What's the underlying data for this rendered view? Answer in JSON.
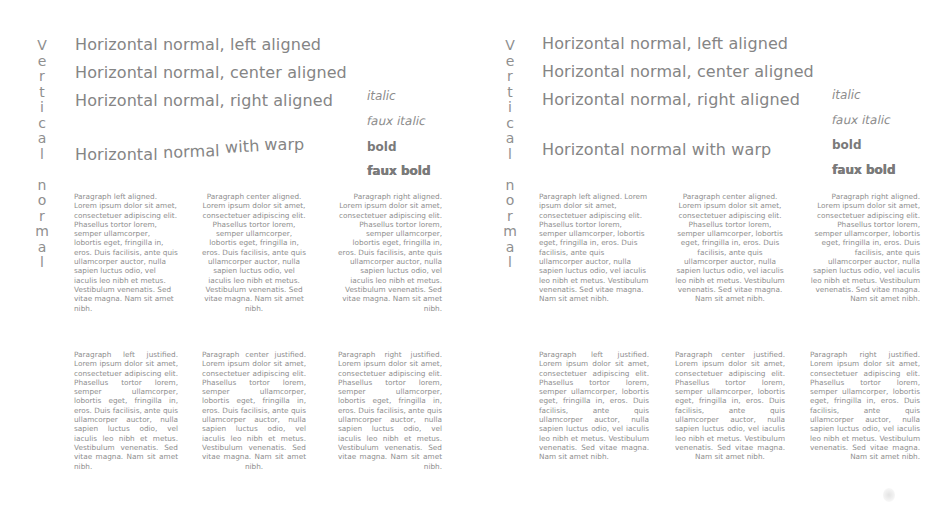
{
  "panels": [
    {
      "id": "left",
      "vertical_text": [
        "V",
        "e",
        "r",
        "t",
        "i",
        "c",
        "a",
        "l",
        "",
        "n",
        "o",
        "r",
        "m",
        "a",
        "l"
      ],
      "headings": {
        "left_aligned": "Horizontal normal, left aligned",
        "center_aligned": "Horizontal normal, center aligned",
        "right_aligned": "Horizontal normal, right aligned",
        "warp": [
          "Horizontal",
          "normal",
          "with",
          "warp"
        ]
      },
      "styles": {
        "italic": "italic",
        "faux_italic": "faux italic",
        "bold": "bold",
        "faux_bold": "faux bold"
      },
      "paragraphs": {
        "left_aligned": "Paragraph left aligned. Lorem ipsum dolor sit amet, consectetuer adipiscing elit. Phasellus tortor lorem, semper ullamcorper, lobortis eget, fringilla in, eros. Duis facilisis, ante quis ullamcorper auctor, nulla sapien luctus odio, vel iaculis leo nibh et metus. Vestibulum venenatis. Sed vitae magna. Nam sit amet nibh.",
        "center_aligned": "Paragraph center aligned. Lorem ipsum dolor sit amet, consectetuer adipiscing elit. Phasellus tortor lorem, semper ullamcorper, lobortis eget, fringilla in, eros. Duis facilisis, ante quis ullamcorper auctor, nulla sapien luctus odio, vel iaculis leo nibh et metus. Vestibulum venenatis. Sed vitae magna. Nam sit amet nibh.",
        "right_aligned": "Paragraph right aligned. Lorem ipsum dolor sit amet, consectetuer adipiscing elit. Phasellus tortor lorem, semper ullamcorper, lobortis eget, fringilla in, eros. Duis facilisis, ante quis ullamcorper auctor, nulla sapien luctus odio, vel iaculis leo nibh et metus. Vestibulum venenatis. Sed vitae magna. Nam sit amet nibh.",
        "left_justified": "Paragraph left justified. Lorem ipsum dolor sit amet, consectetuer adipiscing elit. Phasellus tortor lorem, semper ullamcorper, lobortis eget, fringilla in, eros. Duis facilisis, ante quis ullamcorper auctor, nulla sapien luctus odio, vel iaculis leo nibh et metus. Vestibulum venenatis. Sed vitae magna. Nam sit amet nibh.",
        "center_justified": "Paragraph center justified. Lorem ipsum dolor sit amet, consectetuer adipiscing elit. Phasellus tortor lorem, semper ullamcorper, lobortis eget, fringilla in, eros. Duis facilisis, ante quis ullamcorper auctor, nulla sapien luctus odio, vel iaculis leo nibh et metus. Vestibulum venenatis. Sed vitae magna. Nam sit amet nibh.",
        "right_justified": "Paragraph right justified. Lorem ipsum dolor sit amet, consectetuer adipiscing elit. Phasellus tortor lorem, semper ullamcorper, lobortis eget, fringilla in, eros. Duis facilisis, ante quis ullamcorper auctor, nulla sapien luctus odio, vel iaculis leo nibh et metus. Vestibulum venenatis. Sed vitae magna. Nam sit amet nibh."
      }
    },
    {
      "id": "right",
      "vertical_text": [
        "V",
        "e",
        "r",
        "t",
        "i",
        "c",
        "a",
        "l",
        "",
        "n",
        "o",
        "r",
        "m",
        "a",
        "l"
      ],
      "headings": {
        "left_aligned": "Horizontal normal, left aligned",
        "center_aligned": "Horizontal normal, center aligned",
        "right_aligned": "Horizontal normal, right aligned",
        "warp": [
          "Horizontal",
          "normal",
          "with",
          "warp"
        ]
      },
      "styles": {
        "italic": "italic",
        "faux_italic": "faux italic",
        "bold": "bold",
        "faux_bold": "faux bold"
      },
      "paragraphs": {
        "left_aligned": "Paragraph left aligned. Lorem ipsum dolor sit amet, consectetuer adipiscing elit. Phasellus tortor lorem, semper ullamcorper, lobortis eget, fringilla in, eros. Duis facilisis, ante quis ullamcorper auctor, nulla sapien luctus odio, vel iaculis leo nibh et metus. Vestibulum venenatis. Sed vitae magna. Nam sit amet nibh.",
        "center_aligned": "Paragraph center aligned. Lorem ipsum dolor sit amet, consectetuer adipiscing elit. Phasellus tortor lorem, semper ullamcorper, lobortis eget, fringilla in, eros. Duis facilisis, ante quis ullamcorper auctor, nulla sapien luctus odio, vel iaculis leo nibh et metus. Vestibulum venenatis. Sed vitae magna. Nam sit amet nibh.",
        "right_aligned": "Paragraph right aligned. Lorem ipsum dolor sit amet, consectetuer adipiscing elit. Phasellus tortor lorem, semper ullamcorper, lobortis eget, fringilla in, eros. Duis facilisis, ante quis ullamcorper auctor, nulla sapien luctus odio, vel iaculis leo nibh et metus. Vestibulum venenatis. Sed vitae magna. Nam sit amet nibh.",
        "left_justified": "Paragraph left justified. Lorem ipsum dolor sit amet, consectetuer adipiscing elit. Phasellus tortor lorem, semper ullamcorper, lobortis eget, fringilla in, eros. Duis facilisis, ante quis ullamcorper auctor, nulla sapien luctus odio, vel iaculis leo nibh et metus. Vestibulum venenatis. Sed vitae magna. Nam sit amet nibh.",
        "center_justified": "Paragraph center justified. Lorem ipsum dolor sit amet, consectetuer adipiscing elit. Phasellus tortor lorem, semper ullamcorper, lobortis eget, fringilla in, eros. Duis facilisis, ante quis ullamcorper auctor, nulla sapien luctus odio, vel iaculis leo nibh et metus. Vestibulum venenatis. Sed vitae magna. Nam sit amet nibh.",
        "right_justified": "Paragraph right justified. Lorem ipsum dolor sit amet, consectetuer adipiscing elit. Phasellus tortor lorem, semper ullamcorper, lobortis eget, fringilla in, eros. Duis facilisis, ante quis ullamcorper auctor, nulla sapien luctus odio, vel iaculis leo nibh et metus. Vestibulum venenatis. Sed vitae magna. Nam sit amet nibh."
      }
    }
  ],
  "colors": {
    "background": "#ffffff",
    "text": "#8a8a8a",
    "bold_text": "#7a7a7a"
  }
}
